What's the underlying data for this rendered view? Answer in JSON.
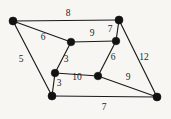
{
  "figure": {
    "kind": "weighted-undirected-graph",
    "background_color": "#f7f6f3",
    "edge_color": "#1a1a1a",
    "vertex_color": "#121212",
    "label_color": "#1d1d1d",
    "width": 171,
    "height": 119
  },
  "vertices": [
    {
      "id": "A",
      "name": "top-left-vertex",
      "x": 13,
      "y": 21,
      "r": 4.0
    },
    {
      "id": "B",
      "name": "top-right-vertex",
      "x": 119,
      "y": 20,
      "r": 4.0
    },
    {
      "id": "C",
      "name": "inner-top-left-vertex",
      "x": 71,
      "y": 42,
      "r": 3.8
    },
    {
      "id": "D",
      "name": "inner-top-right-vertex",
      "x": 116,
      "y": 41,
      "r": 3.8
    },
    {
      "id": "E",
      "name": "inner-bottom-left-vertex",
      "x": 55,
      "y": 73,
      "r": 3.8
    },
    {
      "id": "F",
      "name": "inner-bottom-right-vertex",
      "x": 98,
      "y": 76,
      "r": 3.8
    },
    {
      "id": "G",
      "name": "bottom-left-vertex",
      "x": 52,
      "y": 96,
      "r": 4.0
    },
    {
      "id": "H",
      "name": "bottom-right-vertex",
      "x": 157,
      "y": 97,
      "r": 4.0
    }
  ],
  "edges": [
    {
      "id": "AB",
      "name": "edge-top-left-to-top-right",
      "from": "A",
      "to": "B",
      "weight": "8",
      "label_x": 68,
      "label_y": 14
    },
    {
      "id": "AC",
      "name": "edge-top-left-to-inner-top-left",
      "from": "A",
      "to": "C",
      "weight": "6",
      "label_x": 43,
      "label_y": 38
    },
    {
      "id": "AG",
      "name": "edge-top-left-to-bottom-left",
      "from": "A",
      "to": "G",
      "weight": "5",
      "label_x": 21,
      "label_y": 60
    },
    {
      "id": "CD",
      "name": "edge-inner-top-left-to-inner-top-right",
      "from": "C",
      "to": "D",
      "weight": "9",
      "label_x": 92,
      "label_y": 34
    },
    {
      "id": "BD",
      "name": "edge-top-right-to-inner-top-right",
      "from": "B",
      "to": "D",
      "weight": "7",
      "label_x": 110,
      "label_y": 30
    },
    {
      "id": "BH",
      "name": "edge-top-right-to-bottom-right",
      "from": "B",
      "to": "H",
      "weight": "12",
      "label_x": 144,
      "label_y": 58
    },
    {
      "id": "CE",
      "name": "edge-inner-top-left-to-inner-bottom-left",
      "from": "C",
      "to": "E",
      "weight": "3",
      "label_x": 66,
      "label_y": 60
    },
    {
      "id": "DF",
      "name": "edge-inner-top-right-to-inner-bottom-right",
      "from": "D",
      "to": "F",
      "weight": "6",
      "label_x": 113,
      "label_y": 58
    },
    {
      "id": "EF",
      "name": "edge-inner-bottom-left-to-inner-bottom-right",
      "from": "E",
      "to": "F",
      "weight": "10",
      "label_x": 77,
      "label_y": 78
    },
    {
      "id": "EG",
      "name": "edge-inner-bottom-left-to-bottom-left",
      "from": "E",
      "to": "G",
      "weight": "3",
      "label_x": 59,
      "label_y": 84
    },
    {
      "id": "FH",
      "name": "edge-inner-bottom-right-to-bottom-right",
      "from": "F",
      "to": "H",
      "weight": "9",
      "label_x": 128,
      "label_y": 78
    },
    {
      "id": "GH",
      "name": "edge-bottom-left-to-bottom-right",
      "from": "G",
      "to": "H",
      "weight": "7",
      "label_x": 104,
      "label_y": 108
    }
  ]
}
